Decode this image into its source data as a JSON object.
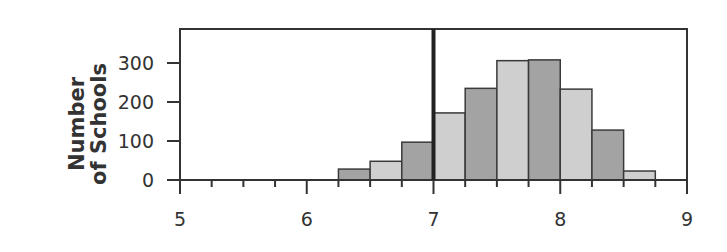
{
  "chart_data": {
    "type": "bar",
    "title": "",
    "xlabel": "",
    "ylabel_line1": "Number",
    "ylabel_line2": "of Schools",
    "ylabel": "Number of Schools",
    "xlim": [
      5,
      9
    ],
    "ylim": [
      0,
      380
    ],
    "x_ticks": [
      5,
      6,
      7,
      8,
      9
    ],
    "x_tick_labels": [
      "5",
      "6",
      "7",
      "8",
      "9"
    ],
    "x_minor_step": 0.25,
    "y_ticks": [
      0,
      100,
      200,
      300
    ],
    "y_tick_labels": [
      "0",
      "100",
      "200",
      "300"
    ],
    "grid": false,
    "legend": null,
    "bin_width": 0.25,
    "bins": [
      {
        "start": 6.25,
        "end": 6.5,
        "value": 28,
        "shade": "dark"
      },
      {
        "start": 6.5,
        "end": 6.75,
        "value": 48,
        "shade": "light"
      },
      {
        "start": 6.75,
        "end": 7.0,
        "value": 97,
        "shade": "dark"
      },
      {
        "start": 7.0,
        "end": 7.25,
        "value": 172,
        "shade": "light"
      },
      {
        "start": 7.25,
        "end": 7.5,
        "value": 235,
        "shade": "dark"
      },
      {
        "start": 7.5,
        "end": 7.75,
        "value": 306,
        "shade": "light"
      },
      {
        "start": 7.75,
        "end": 8.0,
        "value": 308,
        "shade": "dark"
      },
      {
        "start": 8.0,
        "end": 8.25,
        "value": 233,
        "shade": "light"
      },
      {
        "start": 8.25,
        "end": 8.5,
        "value": 128,
        "shade": "dark"
      },
      {
        "start": 8.5,
        "end": 8.75,
        "value": 23,
        "shade": "light"
      }
    ],
    "reference_line": {
      "x": 7,
      "style": "thick vertical"
    },
    "colors": {
      "dark": "#a3a3a3",
      "light": "#cfcfcf",
      "stroke": "#3a3a3a",
      "axis": "#333333"
    }
  }
}
